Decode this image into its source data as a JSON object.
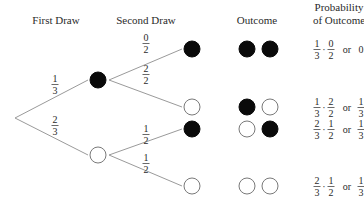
{
  "headers": {
    "first_draw": "First Draw",
    "second_draw": "Second Draw",
    "outcome": "Outcome",
    "probability_line1": "Probability",
    "probability_line2": "of Outcome"
  },
  "colors": {
    "black_ball": "#0a0a0a",
    "white_ball": "#ffffff",
    "branch_line": "#9a9a9a",
    "text": "#2a2a2a"
  },
  "tree": {
    "root": {
      "x": 15,
      "y": 118
    },
    "first_draw": [
      {
        "color": "black",
        "x": 98,
        "y": 80,
        "prob": {
          "num": "1",
          "den": "3"
        }
      },
      {
        "color": "white",
        "x": 98,
        "y": 155,
        "prob": {
          "num": "2",
          "den": "3"
        }
      }
    ],
    "second_draw": [
      {
        "parent": 0,
        "color": "black",
        "x": 192,
        "y": 49,
        "prob": {
          "num": "0",
          "den": "2"
        }
      },
      {
        "parent": 0,
        "color": "white",
        "x": 192,
        "y": 107,
        "prob": {
          "num": "2",
          "den": "2"
        }
      },
      {
        "parent": 1,
        "color": "black",
        "x": 192,
        "y": 129,
        "prob": {
          "num": "1",
          "den": "2"
        }
      },
      {
        "parent": 1,
        "color": "white",
        "x": 192,
        "y": 186,
        "prob": {
          "num": "1",
          "den": "2"
        }
      }
    ]
  },
  "outcomes": [
    {
      "balls": [
        "black",
        "black"
      ],
      "y": 49,
      "p1": {
        "num": "1",
        "den": "3"
      },
      "p2": {
        "num": "0",
        "den": "2"
      },
      "or": "or",
      "result": {
        "whole": "0"
      }
    },
    {
      "balls": [
        "black",
        "white"
      ],
      "y": 107,
      "p1": {
        "num": "1",
        "den": "3"
      },
      "p2": {
        "num": "2",
        "den": "2"
      },
      "or": "or",
      "result": {
        "num": "1",
        "den": "3"
      }
    },
    {
      "balls": [
        "white",
        "black"
      ],
      "y": 129,
      "p1": {
        "num": "2",
        "den": "3"
      },
      "p2": {
        "num": "1",
        "den": "2"
      },
      "or": "or",
      "result": {
        "num": "1",
        "den": "3"
      }
    },
    {
      "balls": [
        "white",
        "white"
      ],
      "y": 186,
      "p1": {
        "num": "2",
        "den": "3"
      },
      "p2": {
        "num": "1",
        "den": "2"
      },
      "or": "or",
      "result": {
        "num": "1",
        "den": "3"
      }
    }
  ],
  "dot": "·"
}
